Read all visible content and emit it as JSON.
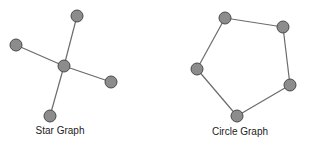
{
  "graphs": [
    {
      "name": "star",
      "label": "Star Graph",
      "label_pos": {
        "x": 60,
        "y": 125
      },
      "nodes": [
        {
          "id": "center",
          "x": 64,
          "y": 66
        },
        {
          "id": "top",
          "x": 77,
          "y": 16
        },
        {
          "id": "left",
          "x": 16,
          "y": 45
        },
        {
          "id": "right",
          "x": 111,
          "y": 82
        },
        {
          "id": "bottom",
          "x": 50,
          "y": 116
        }
      ],
      "edges": [
        [
          "center",
          "top"
        ],
        [
          "center",
          "left"
        ],
        [
          "center",
          "right"
        ],
        [
          "center",
          "bottom"
        ]
      ]
    },
    {
      "name": "circle",
      "label": "Circle Graph",
      "label_pos": {
        "x": 240,
        "y": 126
      },
      "nodes": [
        {
          "id": "n1",
          "x": 225,
          "y": 18
        },
        {
          "id": "n2",
          "x": 283,
          "y": 27
        },
        {
          "id": "n3",
          "x": 290,
          "y": 85
        },
        {
          "id": "n4",
          "x": 237,
          "y": 116
        },
        {
          "id": "n5",
          "x": 197,
          "y": 69
        }
      ],
      "edges": [
        [
          "n1",
          "n2"
        ],
        [
          "n2",
          "n3"
        ],
        [
          "n3",
          "n4"
        ],
        [
          "n4",
          "n5"
        ],
        [
          "n5",
          "n1"
        ]
      ]
    }
  ],
  "style": {
    "node_radius": 6,
    "node_fill": "#8c8c8c",
    "node_stroke": "#4a4a4a",
    "edge_color": "#6b6b6b"
  }
}
